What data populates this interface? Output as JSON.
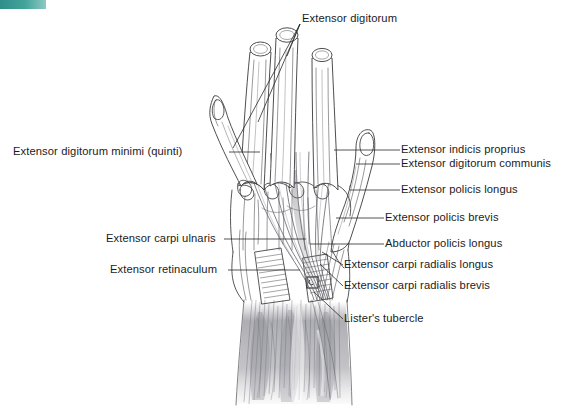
{
  "figure": {
    "kind": "anatomical-illustration",
    "view": "dorsal",
    "background_color": "#ffffff",
    "ink_color": "#3a3a3a",
    "muscle_shading_color": "#9a9aa0",
    "corner_mark_color": "#3f9a93"
  },
  "labels": {
    "top": [
      {
        "id": "extensor-digitorum",
        "text": "Extensor digitorum",
        "x": 302,
        "y": 13,
        "align": "left",
        "leaders": 3
      }
    ],
    "left": [
      {
        "id": "extensor-digitorum-minimi",
        "text": "Extensor digitorum minimi (quinti)",
        "x": 13,
        "y": 146,
        "align": "left",
        "leader_to_x": 241,
        "leader_to_y": 152
      },
      {
        "id": "extensor-carpi-ulnaris",
        "text": "Extensor carpi ulnaris",
        "x": 106,
        "y": 233,
        "align": "left",
        "leader_to_x": 252,
        "leader_to_y": 239
      },
      {
        "id": "extensor-retinaculum",
        "text": "Extensor retinaculum",
        "x": 110,
        "y": 264,
        "align": "left",
        "leader_to_x": 256,
        "leader_to_y": 270
      }
    ],
    "right": [
      {
        "id": "extensor-indicis-proprius",
        "text": "Extensor indicis proprius",
        "x": 402,
        "y": 144,
        "align": "left",
        "leader_to_x": 342,
        "leader_to_y": 150
      },
      {
        "id": "extensor-digitorum-communis",
        "text": "Extensor digitorum communis",
        "x": 402,
        "y": 158,
        "align": "left",
        "leader_to_x": 352,
        "leader_to_y": 164
      },
      {
        "id": "extensor-policis-longus",
        "text": "Extensor policis longus",
        "x": 402,
        "y": 184,
        "align": "left",
        "leader_to_x": 352,
        "leader_to_y": 190
      },
      {
        "id": "extensor-policis-brevis",
        "text": "Extensor policis brevis",
        "x": 386,
        "y": 212,
        "align": "left",
        "leader_to_x": 330,
        "leader_to_y": 218
      },
      {
        "id": "abductor-policis-longus",
        "text": "Abductor policis longus",
        "x": 386,
        "y": 238,
        "align": "left",
        "leader_to_x": 330,
        "leader_to_y": 244
      },
      {
        "id": "extensor-carpi-radialis-longus",
        "text": "Extensor carpi radialis longus",
        "x": 345,
        "y": 259,
        "align": "left",
        "leader_to_x": 322,
        "leader_to_y": 252
      },
      {
        "id": "extensor-carpi-radialis-brevis",
        "text": "Extensor carpi radialis brevis",
        "x": 345,
        "y": 280,
        "align": "left",
        "leader_to_x": 322,
        "leader_to_y": 266
      },
      {
        "id": "listers-tubercle",
        "text": "Lister's tubercle",
        "x": 345,
        "y": 313,
        "align": "left",
        "leader_to_x": 316,
        "leader_to_y": 288
      }
    ]
  },
  "structures": {
    "digits": [
      {
        "id": "digit-2-index",
        "name": "Index finger",
        "state": "transected",
        "cross_section": true
      },
      {
        "id": "digit-3-middle",
        "name": "Middle finger",
        "state": "transected",
        "cross_section": true
      },
      {
        "id": "digit-4-ring",
        "name": "Ring finger",
        "state": "transected",
        "cross_section": true
      },
      {
        "id": "digit-5-little",
        "name": "Little finger",
        "state": "intact",
        "cross_section": false
      },
      {
        "id": "digit-1-thumb",
        "name": "Thumb",
        "state": "intact",
        "cross_section": false
      }
    ],
    "regions": [
      {
        "id": "dorsum-of-hand",
        "name": "Dorsum of hand"
      },
      {
        "id": "extensor-retinaculum-band",
        "name": "Extensor retinaculum"
      },
      {
        "id": "listers-tubercle-mark",
        "name": "Lister's tubercle"
      },
      {
        "id": "forearm-muscle-bellies",
        "name": "Forearm extensor muscle bellies"
      }
    ]
  }
}
